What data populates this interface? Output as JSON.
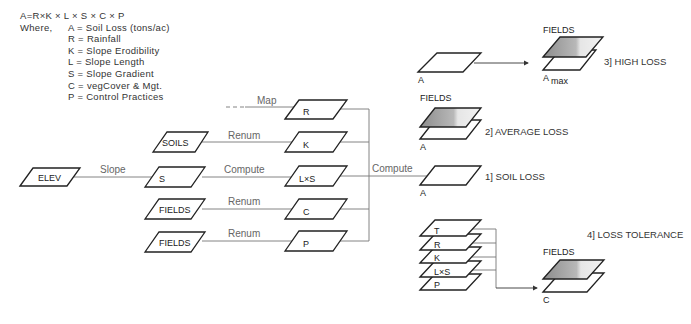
{
  "legend": {
    "equation": "A=R×K × L × S × C × P",
    "where_label": "Where,",
    "definitions": [
      "A = Soil Loss (tons/ac)",
      "R = Rainfall",
      "K = Slope Erodibility",
      "L = Slope Length",
      "S = Slope Gradient",
      "C = vegCover & Mgt.",
      "P = Control Practices"
    ]
  },
  "inputs": {
    "elev": "ELEV",
    "soils": "SOILS",
    "fields1": "FIELDS",
    "fields2": "FIELDS",
    "s": "S"
  },
  "operations": {
    "map": "Map",
    "renum_soils": "Renum",
    "slope": "Slope",
    "compute_ls": "Compute",
    "renum_c": "Renum",
    "renum_p": "Renum",
    "compute_a": "Compute"
  },
  "factors": {
    "r": "R",
    "k": "K",
    "ls": "L×S",
    "c": "C",
    "p": "P"
  },
  "outputs": {
    "soil_loss": {
      "title": "1] SOIL LOSS",
      "layer": "A"
    },
    "average_loss": {
      "title": "2] AVERAGE LOSS",
      "top_layer": "FIELDS",
      "bottom_layer": "A"
    },
    "high_loss": {
      "title": "3] HIGH LOSS",
      "source_layer": "A",
      "top_layer": "FIELDS",
      "bottom_layer": "A",
      "bottom_subscript": "max"
    },
    "loss_tolerance": {
      "title": "4] LOSS TOLERANCE",
      "stack": [
        "T",
        "R",
        "K",
        "L×S",
        "P"
      ],
      "top_layer": "FIELDS",
      "bottom_layer": "C"
    }
  }
}
